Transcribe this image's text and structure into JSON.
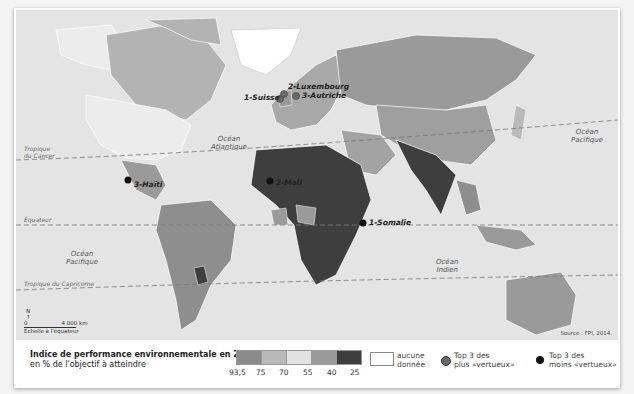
{
  "map": {
    "oceans": [
      {
        "id": "atlantic",
        "label_line1": "Océan",
        "label_line2": "Atlantique"
      },
      {
        "id": "pacific-west",
        "label_line1": "Océan",
        "label_line2": "Pacifique"
      },
      {
        "id": "pacific-east",
        "label_line1": "Océan",
        "label_line2": "Pacifique"
      },
      {
        "id": "indian",
        "label_line1": "Océan",
        "label_line2": "Indien"
      }
    ],
    "lines": {
      "cancer_l1": "Tropique",
      "cancer_l2": "du Cancer",
      "equator": "Équateur",
      "capricorn": "Tropique du Capricorne"
    },
    "places": {
      "suisse": "1-Suisse",
      "luxembourg": "2-Luxembourg",
      "autriche": "3-Autriche",
      "haiti": "3-Haïti",
      "mali": "2-Mali",
      "somalie": "1-Somalie"
    },
    "scale": {
      "north": "N",
      "zero": "0",
      "distance": "4 000 km",
      "caption": "Échelle à l'équateur"
    },
    "source": "Source : FPI, 2014."
  },
  "legend": {
    "title_line1": "Indice de performance environnementale en 2014,",
    "title_line2": "en % de l'objectif à atteindre",
    "ramp_colors": [
      "#8a8a8a",
      "#b9b9b9",
      "#e2e2e2",
      "#9a9a9a",
      "#3e3e3e"
    ],
    "ramp_labels": [
      "93,5",
      "75",
      "70",
      "55",
      "40",
      "25"
    ],
    "no_data_line1": "aucune",
    "no_data_line2": "donnée",
    "top_line1": "Top 3 des",
    "top_line2": "plus «vertueux»",
    "top_color": "#6a6a6a",
    "bottom_line1": "Top 3 des",
    "bottom_line2": "moins «vertueux»",
    "bottom_color": "#111111"
  }
}
